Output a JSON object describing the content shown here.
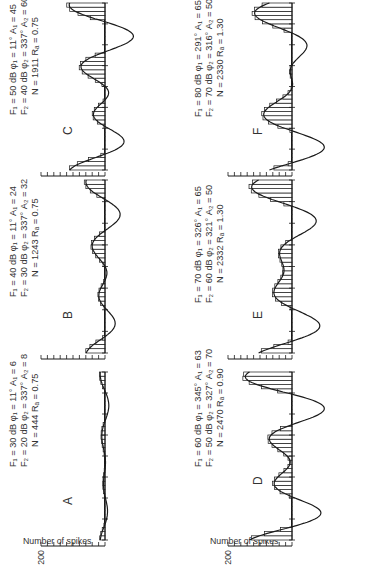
{
  "figure": {
    "ylabel": "Number of spikes",
    "count_tick_label": "200",
    "ink_color": "#1a1a1a",
    "text_color": "#333333"
  },
  "chart_data": [
    {
      "type": "bar",
      "panel": "A",
      "title": "A",
      "ylabel": "Number of spikes",
      "ytick_label": "200",
      "ylim": [
        0,
        200
      ],
      "params": {
        "F1": "30 dB",
        "F2": "20 dB",
        "phi1": "11°",
        "phi2": "337°",
        "A1": "6",
        "A2": "8",
        "N": "444",
        "RA": "0.75"
      },
      "param_lines": [
        "F₁ = 30 dB   φ₁ = 11°   A₁ = 6",
        "F₂ = 20 dB   φ₂ = 337°   A₂ = 8",
        "N = 444   Rₐ = 0.75"
      ],
      "fit": {
        "A1": 6,
        "A2": 8,
        "phi1_deg": 11,
        "phi2_deg": 337,
        "cycles": 2
      },
      "bin_count": 40,
      "peak_counts_est": [
        22,
        6,
        14,
        4,
        12,
        6,
        15
      ]
    },
    {
      "type": "bar",
      "panel": "B",
      "title": "B",
      "ylabel": "Number of spikes",
      "ytick_label": "200",
      "ylim": [
        0,
        200
      ],
      "params": {
        "F1": "40 dB",
        "F2": "30 dB",
        "phi1": "11°",
        "phi2": "337°",
        "A1": "24",
        "A2": "32",
        "N": "1243",
        "RA": "0.75"
      },
      "param_lines": [
        "F₁ = 40 dB   φ₁ = 11°   A₁ = 24",
        "F₂ = 30 dB   φ₂ = 337°   A₂ = 32",
        "N = 1243   Rₐ = 0.75"
      ],
      "fit": {
        "A1": 24,
        "A2": 32,
        "phi1_deg": 11,
        "phi2_deg": 337,
        "cycles": 2
      },
      "bin_count": 40,
      "peak_counts_est": [
        60,
        24,
        38,
        8,
        28
      ]
    },
    {
      "type": "bar",
      "panel": "C",
      "title": "C",
      "ylabel": "Number of spikes",
      "ytick_label": "200",
      "ylim": [
        0,
        200
      ],
      "params": {
        "F1": "50 dB",
        "F2": "40 dB",
        "phi1": "11°",
        "phi2": "337°",
        "A1": "45",
        "A2": "60",
        "N": "1911",
        "RA": "0.75"
      },
      "param_lines": [
        "F₁ = 50 dB   φ₁ = 11°   A₁ = 45",
        "F₂ = 40 dB   φ₂ = 337°   A₂ = 60",
        "N = 1911   Rₐ = 0.75"
      ],
      "fit": {
        "A1": 45,
        "A2": 60,
        "phi1_deg": 11,
        "phi2_deg": 337,
        "cycles": 2
      },
      "bin_count": 40,
      "peak_counts_est": [
        112,
        70,
        12,
        60
      ]
    },
    {
      "type": "bar",
      "panel": "D",
      "title": "D",
      "ylabel": "Number of spikes",
      "ytick_label": "200",
      "ylim": [
        0,
        200
      ],
      "params": {
        "F1": "60 dB",
        "F2": "50 dB",
        "phi1": "345°",
        "phi2": "327°",
        "A1": "63",
        "A2": "70",
        "N": "2470",
        "RA": "0.90"
      },
      "param_lines": [
        "F₁ = 60 dB   φ₁ = 345°   A₁ = 63",
        "F₂ = 50 dB   φ₂ = 327°   A₂ = 70",
        "N = 2470   Rₐ = 0.90"
      ],
      "fit": {
        "A1": 63,
        "A2": 70,
        "phi1_deg": 345,
        "phi2_deg": 327,
        "cycles": 2
      },
      "bin_count": 40,
      "peak_counts_est": [
        140,
        80,
        6,
        110
      ]
    },
    {
      "type": "bar",
      "panel": "E",
      "title": "E",
      "ylabel": "Number of spikes",
      "ytick_label": "200",
      "ylim": [
        0,
        200
      ],
      "params": {
        "F1": "70 dB",
        "F2": "60 dB",
        "phi1": "326°",
        "phi2": "321°",
        "A1": "65",
        "A2": "50",
        "N": "2332",
        "RA": "1.30"
      },
      "param_lines": [
        "F₁ = 70 dB   φ₁ = 326°   A₁ = 65",
        "F₂ = 60 dB   φ₂ = 321°   A₂ = 50",
        "N = 2332   Rₐ = 1.30"
      ],
      "fit": {
        "A1": 65,
        "A2": 50,
        "phi1_deg": 326,
        "phi2_deg": 321,
        "cycles": 2
      },
      "bin_count": 40,
      "peak_counts_est": [
        125,
        55,
        4,
        115
      ]
    },
    {
      "type": "bar",
      "panel": "F",
      "title": "F",
      "ylabel": "Number of spikes",
      "ytick_label": "200",
      "ylim": [
        0,
        200
      ],
      "params": {
        "F1": "80 dB",
        "F2": "70 dB",
        "phi1": "291°",
        "phi2": "316°",
        "A1": "65",
        "A2": "50",
        "N": "2330",
        "RA": "1.30"
      },
      "param_lines": [
        "F₁ = 80 dB   φ₁ = 291°   A₁ = 65",
        "F₂ = 70 dB   φ₂ = 316°   A₂ = 50",
        "N = 2330   Rₐ = 1.30"
      ],
      "fit": {
        "A1": 65,
        "A2": 50,
        "phi1_deg": 291,
        "phi2_deg": 316,
        "cycles": 2
      },
      "bin_count": 40,
      "peak_counts_est": [
        120,
        58,
        4,
        118
      ]
    }
  ]
}
